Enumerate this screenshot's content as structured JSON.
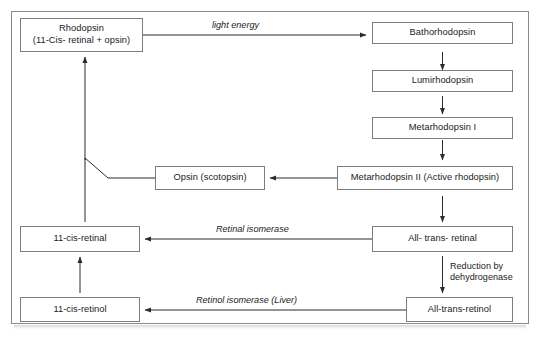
{
  "figure": {
    "background_color": "#ffffff",
    "frame_color": "#8a8a8a",
    "box_border_color": "#7d7d7d",
    "text_color": "#1b1b1b",
    "arrow_color": "#2b2b2b"
  },
  "nodes": {
    "rhodopsin": {
      "line1": "Rhodopsin",
      "line2": "(11-Cis- retinal + opsin)"
    },
    "bathorhodopsin": {
      "label": "Bathorhodopsin"
    },
    "lumirhodopsin": {
      "label": "Lumirhodopsin"
    },
    "metarhodopsin_1": {
      "label": "Metarhodopsin I"
    },
    "metarhodopsin_2": {
      "label": "Metarhodopsin II (Active rhodopsin)"
    },
    "opsin": {
      "label": "Opsin (scotopsin)"
    },
    "all_trans_retinal": {
      "label": "All- trans- retinal"
    },
    "cis_retinal": {
      "label": "11-cis-retinal"
    },
    "all_trans_retinol": {
      "label": "All-trans-retinol"
    },
    "cis_retinol": {
      "label": "11-cis-retinol"
    }
  },
  "edge_labels": {
    "light_energy": "light energy",
    "retinal_isomerase": "Retinal isomerase",
    "retinol_isomerase_liver": "Retinol isomerase (Liver)",
    "reduction_line1": "Reduction by",
    "reduction_line2": "dehydrogenase"
  }
}
